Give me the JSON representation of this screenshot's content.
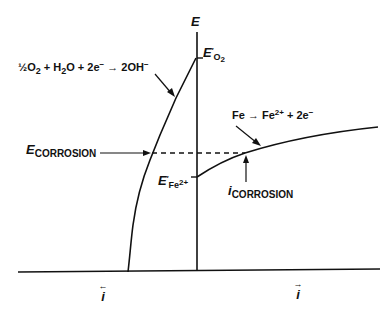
{
  "diagram": {
    "axes": {
      "y_axis_label": "E",
      "x_axis_left_label": "i",
      "x_axis_left_arrow": "←",
      "x_axis_right_label": "i",
      "x_axis_right_arrow": "→"
    },
    "reactions": {
      "cathodic": {
        "half": "½O",
        "o_sub": "2",
        "plus1": " + H",
        "h_sub": "2",
        "rest": "O + 2e",
        "e_sup": "−",
        "arrow": " → 2OH",
        "oh_sup": "−"
      },
      "anodic": {
        "lhs": "Fe → Fe",
        "fe_sup": "2+",
        "rest": "  +  2e",
        "e_sup": "−"
      }
    },
    "labels": {
      "e_o2": {
        "main": "E",
        "prime": "′",
        "sub": "O",
        "sub2": "2"
      },
      "e_fe2": {
        "main": "E",
        "prime": "′",
        "sub": "Fe",
        "sup": "2+"
      },
      "e_corrosion": {
        "main": "E",
        "sub": "CORROSION"
      },
      "i_corrosion": {
        "main": "i",
        "sub": "CORROSION"
      }
    },
    "colors": {
      "line": "#111111",
      "background": "#ffffff"
    }
  }
}
